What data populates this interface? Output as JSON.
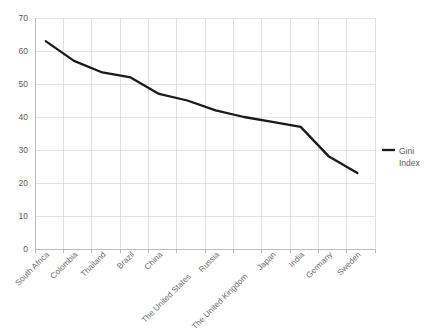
{
  "chart_data": {
    "type": "line",
    "title": "",
    "xlabel": "",
    "ylabel": "",
    "ylim": [
      0,
      70
    ],
    "ytick_step": 10,
    "yticks": [
      "0",
      "10",
      "20",
      "30",
      "40",
      "50",
      "60",
      "70"
    ],
    "grid": true,
    "legend_position": "right",
    "categories": [
      "South Africa",
      "Colombia",
      "Thailand",
      "Brazil",
      "China",
      "The United States",
      "Russia",
      "The United Kingdom",
      "Japan",
      "India",
      "Germany",
      "Sweden"
    ],
    "series": [
      {
        "name": "Gini Index",
        "color": "#1a1a1a",
        "values": [
          63,
          57,
          53.5,
          52,
          47,
          45,
          42,
          40,
          38.5,
          37,
          28,
          23
        ]
      }
    ]
  },
  "legend": {
    "entries": [
      {
        "line1": "Gini",
        "line2": "Index",
        "swatch_color": "#1a1a1a"
      }
    ]
  }
}
